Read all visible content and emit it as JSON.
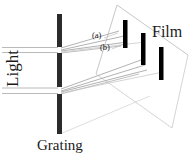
{
  "figure": {
    "type": "optics-diagram",
    "labels": {
      "light": "Light",
      "grating": "Grating",
      "film": "Film",
      "order_a": "(a)",
      "order_b": "(b)"
    },
    "colors": {
      "background": "#ffffff",
      "ink": "#1a1a1a",
      "grating_bar": "#2b2b2b",
      "film_bar": "#000000",
      "ray_line": "#9a9a9a",
      "plane_outline": "#b5b5b5"
    },
    "grating": {
      "x": 57,
      "top": 14,
      "bottom": 134,
      "width": 5,
      "slits": [
        {
          "y_top": 47,
          "y_bottom": 53
        },
        {
          "y_top": 87,
          "y_bottom": 94
        }
      ]
    },
    "film_plane": {
      "corners": [
        [
          117,
          5
        ],
        [
          96,
          74
        ],
        [
          172,
          128
        ],
        [
          188,
          55
        ]
      ],
      "bars": [
        {
          "x": 123,
          "y_top": 20,
          "height": 28,
          "width": 4.5
        },
        {
          "x": 141,
          "y_top": 33,
          "height": 32,
          "width": 4.5
        },
        {
          "x": 159,
          "y_top": 47,
          "height": 33,
          "width": 4.5
        }
      ]
    },
    "beams": [
      {
        "name": "upper-incident",
        "from": [
          2,
          50
        ],
        "to": [
          57,
          50
        ]
      },
      {
        "name": "lower-incident",
        "from": [
          2,
          91
        ],
        "to": [
          57,
          91
        ]
      }
    ],
    "diffracted_fans": [
      {
        "name": "upper-fan",
        "origin": [
          60,
          50
        ],
        "targets": [
          [
            118,
            32
          ],
          [
            124,
            37
          ],
          [
            127,
            42
          ],
          [
            120,
            45
          ]
        ]
      },
      {
        "name": "lower-fan",
        "origin": [
          60,
          91
        ],
        "targets": [
          [
            140,
            61
          ],
          [
            144,
            66
          ],
          [
            146,
            71
          ],
          [
            138,
            74
          ]
        ]
      }
    ]
  }
}
